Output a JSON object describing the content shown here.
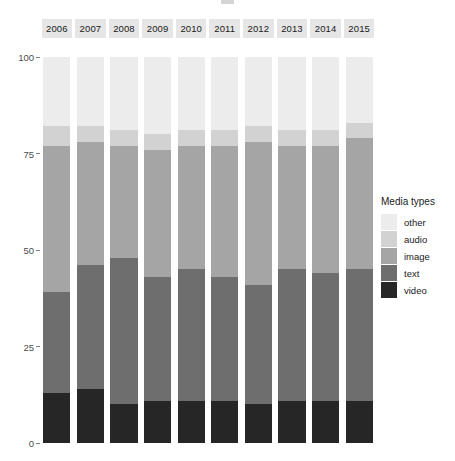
{
  "chart_data": {
    "type": "bar",
    "stacked": true,
    "stack_total": 100,
    "title": "",
    "xlabel": "",
    "ylabel": "",
    "ylim": [
      0,
      100
    ],
    "yticks": [
      0,
      25,
      50,
      75,
      100
    ],
    "grid": false,
    "legend_position": "right",
    "legend_title": "Media types",
    "categories": [
      "2006",
      "2007",
      "2008",
      "2009",
      "2010",
      "2011",
      "2012",
      "2013",
      "2014",
      "2015"
    ],
    "series": [
      {
        "name": "video",
        "color": "#262626",
        "values": [
          13,
          14,
          10,
          11,
          11,
          11,
          10,
          11,
          11,
          11
        ]
      },
      {
        "name": "text",
        "color": "#6e6e6e",
        "values": [
          26,
          32,
          38,
          32,
          34,
          32,
          31,
          34,
          33,
          34
        ]
      },
      {
        "name": "image",
        "color": "#a5a5a5",
        "values": [
          38,
          32,
          29,
          33,
          32,
          34,
          37,
          32,
          33,
          34
        ]
      },
      {
        "name": "audio",
        "color": "#d2d2d2",
        "values": [
          5,
          4,
          4,
          4,
          4,
          4,
          4,
          4,
          4,
          4
        ]
      },
      {
        "name": "other",
        "color": "#ececec",
        "values": [
          18,
          18,
          19,
          20,
          19,
          19,
          18,
          19,
          19,
          17
        ]
      }
    ]
  },
  "axis": {
    "y_tick_labels": [
      "0",
      "25",
      "50",
      "75",
      "100"
    ]
  },
  "legend": {
    "title": "Media types",
    "entries": [
      {
        "label": "other",
        "color": "#ececec"
      },
      {
        "label": "audio",
        "color": "#d2d2d2"
      },
      {
        "label": "image",
        "color": "#a5a5a5"
      },
      {
        "label": "text",
        "color": "#6e6e6e"
      },
      {
        "label": "video",
        "color": "#262626"
      }
    ]
  },
  "facets": {
    "labels": [
      "2006",
      "2007",
      "2008",
      "2009",
      "2010",
      "2011",
      "2012",
      "2013",
      "2014",
      "2015"
    ],
    "strip_background": "#e6e6e6"
  }
}
